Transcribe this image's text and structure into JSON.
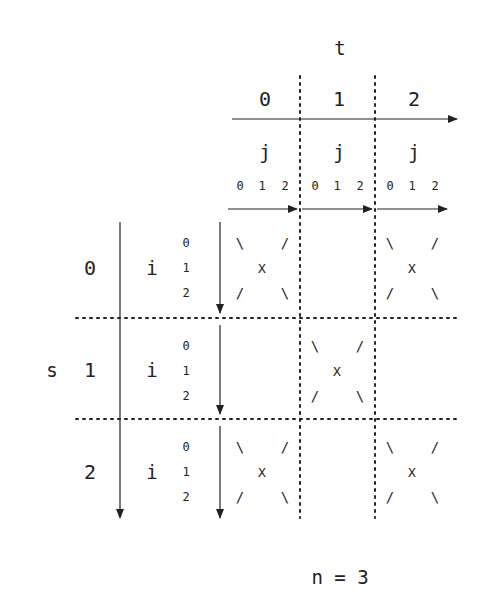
{
  "diagram": {
    "n_label": "n = 3",
    "t_axis": {
      "label": "t",
      "values": [
        "0",
        "1",
        "2"
      ],
      "sub_label": "j",
      "sub_values": [
        "0",
        "1",
        "2"
      ]
    },
    "s_axis": {
      "label": "s",
      "values": [
        "0",
        "1",
        "2"
      ],
      "sub_label": "i",
      "sub_values": [
        "0",
        "1",
        "2"
      ]
    },
    "cell_glyphs": {
      "top_left": "\\",
      "top_right": "/",
      "center": "X",
      "bottom_left": "/",
      "bottom_right": "\\"
    },
    "active_cells": [
      {
        "s": 0,
        "t": 0
      },
      {
        "s": 0,
        "t": 2
      },
      {
        "s": 1,
        "t": 1
      },
      {
        "s": 2,
        "t": 0
      },
      {
        "s": 2,
        "t": 2
      }
    ],
    "colors": {
      "ink": "#222222",
      "background": "#ffffff"
    }
  }
}
